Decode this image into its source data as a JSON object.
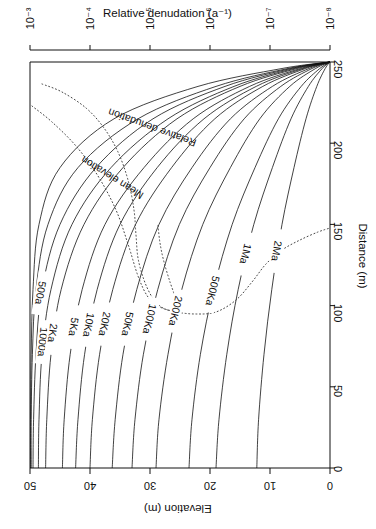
{
  "figure": {
    "top_axis": {
      "title": "Relative denudation (a⁻¹)",
      "ticks": [
        "10⁻³",
        "10⁻⁴",
        "10⁻⁵",
        "10⁻⁶",
        "10⁻⁷",
        "10⁻⁸"
      ]
    },
    "right_axis": {
      "title": "Distance (m)",
      "ticks": [
        "250",
        "200",
        "150",
        "100",
        "50",
        "0"
      ]
    },
    "bottom_axis": {
      "title": "Elevation (m)",
      "ticks": [
        "50",
        "40",
        "30",
        "20",
        "10",
        "0"
      ]
    }
  },
  "curve_labels": [
    "500a",
    "1000a",
    "2Ka",
    "5Ka",
    "10Ka",
    "20Ka",
    "50Ka",
    "100Ka",
    "200Ka",
    "500Ka",
    "1Ma",
    "2Ma"
  ],
  "dotted_labels": [
    "Relative denudation",
    "Mean elevation"
  ],
  "chart_data": {
    "type": "line",
    "title": "",
    "xlabel": "Elevation (m)",
    "ylabel": "Distance (m)",
    "x2label": "Relative denudation (a⁻¹)",
    "xlim": [
      50,
      0
    ],
    "ylim": [
      0,
      250
    ],
    "x2lim_log": [
      -3,
      -8
    ],
    "grid": false,
    "legend": "inline-curve-labels",
    "note": "Hillslope evolution profiles: elevation vs distance for increasing model time. All profiles pinned at (elevation 0, distance 250) top-right; divide at distance 0.",
    "series": [
      {
        "name": "100a",
        "labelled": false,
        "x": [
          49.9,
          49.9,
          49.8,
          49.5,
          48.5,
          45.0,
          36.0,
          22.0,
          8.0,
          0.0
        ],
        "y": [
          0,
          30,
          70,
          110,
          150,
          185,
          215,
          235,
          246,
          250
        ]
      },
      {
        "name": "200a",
        "labelled": false,
        "x": [
          49.8,
          49.8,
          49.6,
          49.0,
          47.0,
          42.0,
          32.0,
          19.0,
          7.0,
          0.0
        ],
        "y": [
          0,
          30,
          70,
          110,
          150,
          185,
          215,
          235,
          246,
          250
        ]
      },
      {
        "name": "500a",
        "labelled": true,
        "x": [
          49.5,
          49.4,
          49.0,
          48.0,
          45.0,
          39.0,
          29.5,
          17.5,
          6.5,
          0.0
        ],
        "y": [
          0,
          30,
          70,
          110,
          150,
          185,
          215,
          235,
          246,
          250
        ]
      },
      {
        "name": "1000a",
        "labelled": true,
        "x": [
          48.6,
          48.5,
          48.0,
          46.5,
          43.0,
          36.5,
          27.0,
          16.0,
          6.0,
          0.0
        ],
        "y": [
          0,
          30,
          70,
          110,
          150,
          185,
          215,
          235,
          246,
          250
        ]
      },
      {
        "name": "2Ka",
        "labelled": true,
        "x": [
          47.4,
          47.2,
          46.5,
          44.8,
          41.0,
          34.5,
          25.5,
          15.0,
          5.5,
          0.0
        ],
        "y": [
          0,
          30,
          70,
          110,
          150,
          185,
          215,
          235,
          246,
          250
        ]
      },
      {
        "name": "5Ka",
        "labelled": true,
        "x": [
          44.6,
          44.3,
          43.3,
          41.3,
          37.5,
          31.0,
          22.8,
          13.4,
          4.9,
          0.0
        ],
        "y": [
          0,
          30,
          70,
          110,
          150,
          185,
          215,
          235,
          246,
          250
        ]
      },
      {
        "name": "10Ka",
        "labelled": true,
        "x": [
          42.4,
          42.0,
          40.9,
          38.8,
          35.0,
          28.8,
          21.0,
          12.3,
          4.5,
          0.0
        ],
        "y": [
          0,
          30,
          70,
          110,
          150,
          185,
          215,
          235,
          246,
          250
        ]
      },
      {
        "name": "20Ka",
        "labelled": true,
        "x": [
          40.0,
          39.6,
          38.4,
          36.2,
          32.4,
          26.4,
          19.2,
          11.2,
          4.1,
          0.0
        ],
        "y": [
          0,
          30,
          70,
          110,
          150,
          185,
          215,
          235,
          246,
          250
        ]
      },
      {
        "name": "50Ka",
        "labelled": true,
        "x": [
          36.3,
          35.8,
          34.5,
          32.2,
          28.5,
          23.0,
          16.6,
          9.6,
          3.5,
          0.0
        ],
        "y": [
          0,
          30,
          70,
          110,
          150,
          185,
          215,
          235,
          246,
          250
        ]
      },
      {
        "name": "100Ka",
        "labelled": true,
        "x": [
          33.0,
          32.5,
          31.1,
          28.7,
          25.1,
          20.0,
          14.3,
          8.2,
          3.0,
          0.0
        ],
        "y": [
          0,
          30,
          70,
          110,
          150,
          185,
          215,
          235,
          246,
          250
        ]
      },
      {
        "name": "200Ka",
        "labelled": true,
        "x": [
          29.0,
          28.5,
          27.0,
          24.7,
          21.2,
          16.6,
          11.7,
          6.7,
          2.4,
          0.0
        ],
        "y": [
          0,
          30,
          70,
          110,
          150,
          185,
          215,
          235,
          246,
          250
        ]
      },
      {
        "name": "500Ka",
        "labelled": true,
        "x": [
          23.5,
          23.0,
          21.6,
          19.4,
          16.3,
          12.5,
          8.6,
          4.8,
          1.7,
          0.0
        ],
        "y": [
          0,
          30,
          70,
          110,
          150,
          185,
          215,
          235,
          246,
          250
        ]
      },
      {
        "name": "1Ma",
        "labelled": true,
        "x": [
          19.0,
          18.5,
          17.2,
          15.3,
          12.7,
          9.6,
          6.5,
          3.6,
          1.3,
          0.0
        ],
        "y": [
          0,
          30,
          70,
          110,
          150,
          185,
          215,
          235,
          246,
          250
        ]
      },
      {
        "name": "2Ma",
        "labelled": true,
        "x": [
          12.2,
          11.9,
          11.0,
          9.7,
          8.0,
          6.0,
          4.0,
          2.2,
          0.8,
          0.0
        ],
        "y": [
          0,
          30,
          70,
          110,
          150,
          185,
          215,
          235,
          246,
          250
        ]
      }
    ],
    "dotted_series": [
      {
        "name": "Relative denudation",
        "style": "dotted",
        "px": [
          [
            42,
            84
          ],
          [
            62,
            92
          ],
          [
            86,
            108
          ],
          [
            104,
            128
          ],
          [
            118,
            152
          ],
          [
            128,
            180
          ],
          [
            134,
            210
          ],
          [
            136,
            235
          ],
          [
            138,
            258
          ],
          [
            144,
            280
          ],
          [
            152,
            297
          ],
          [
            160,
            306
          ],
          [
            168,
            310
          ],
          [
            176,
            310
          ],
          [
            176,
            300
          ],
          [
            170,
            282
          ],
          [
            164,
            262
          ],
          [
            160,
            243
          ],
          [
            158,
            225
          ]
        ]
      },
      {
        "name": "Mean elevation",
        "style": "dotted",
        "px": [
          [
            32,
            106
          ],
          [
            52,
            122
          ],
          [
            76,
            146
          ],
          [
            98,
            176
          ],
          [
            116,
            210
          ],
          [
            128,
            244
          ],
          [
            138,
            276
          ],
          [
            148,
            297
          ],
          [
            160,
            307
          ],
          [
            176,
            312
          ],
          [
            196,
            314
          ],
          [
            216,
            312
          ],
          [
            236,
            300
          ],
          [
            252,
            282
          ],
          [
            266,
            264
          ],
          [
            282,
            250
          ],
          [
            300,
            240
          ],
          [
            318,
            232
          ],
          [
            330,
            228
          ]
        ]
      }
    ]
  }
}
